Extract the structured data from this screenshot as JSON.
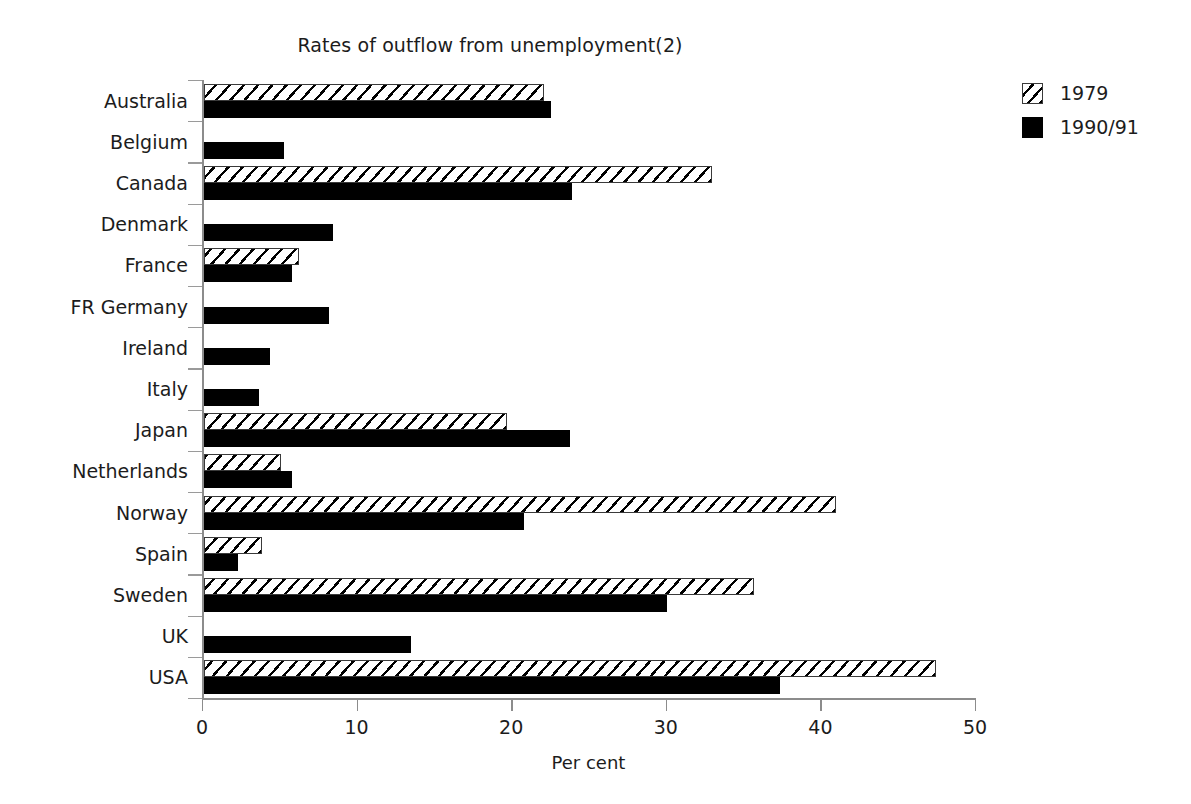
{
  "chart_data": {
    "type": "bar",
    "orientation": "horizontal",
    "title": "Rates of outflow from unemployment(2)",
    "xlabel": "Per cent",
    "ylabel": "",
    "xlim": [
      0,
      50
    ],
    "xticks": [
      0,
      10,
      20,
      30,
      40,
      50
    ],
    "xtick_labels": [
      "0",
      "10",
      "20",
      "30",
      "40",
      "50"
    ],
    "grid": false,
    "legend_position": "right",
    "categories": [
      "Australia",
      "Belgium",
      "Canada",
      "Denmark",
      "France",
      "FR Germany",
      "Ireland",
      "Italy",
      "Japan",
      "Netherlands",
      "Norway",
      "Spain",
      "Sweden",
      "UK",
      "USA"
    ],
    "series": [
      {
        "name": "1979",
        "fill": "hatched",
        "color": "#ffffff",
        "values": [
          22.0,
          null,
          32.9,
          null,
          6.2,
          null,
          null,
          null,
          19.6,
          5.0,
          40.9,
          3.8,
          35.6,
          null,
          47.4
        ]
      },
      {
        "name": "1990/91",
        "fill": "solid",
        "color": "#000000",
        "values": [
          22.5,
          5.2,
          23.8,
          8.4,
          5.7,
          8.1,
          4.3,
          3.6,
          23.7,
          5.7,
          20.7,
          2.2,
          30.0,
          13.4,
          37.3
        ]
      }
    ]
  },
  "legend": {
    "items": [
      {
        "label": "1979",
        "swatch": "hatched-square-icon"
      },
      {
        "label": "1990/91",
        "swatch": "solid-square-icon"
      }
    ]
  }
}
